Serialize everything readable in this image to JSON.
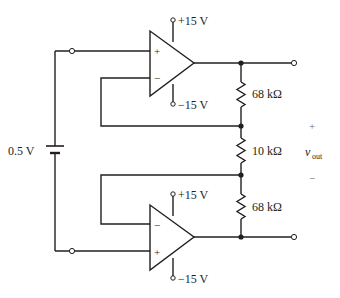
{
  "diagram": {
    "type": "circuit-schematic",
    "battery": {
      "label": "0.5 V"
    },
    "opamps": [
      {
        "id": "top",
        "noninverting_label": "+",
        "inverting_label": "−",
        "supply_pos": "+15 V",
        "supply_neg": "−15 V"
      },
      {
        "id": "bottom",
        "inverting_label": "−",
        "noninverting_label": "+",
        "supply_pos": "+15 V",
        "supply_neg": "−15 V"
      }
    ],
    "resistors": [
      {
        "label": "68 kΩ"
      },
      {
        "label": "10 kΩ"
      },
      {
        "label": "68 kΩ"
      }
    ],
    "output": {
      "plus": "+",
      "label_main": "v",
      "label_sub": "out",
      "minus": "−"
    },
    "colors": {
      "line": "#231f20",
      "polarity": "#6d6e71",
      "background": "#ffffff"
    }
  }
}
